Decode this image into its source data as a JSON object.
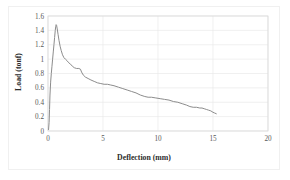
{
  "figure": {
    "background_color": "#ffffff",
    "frame_color": "#f0f0f0",
    "plot_border_color": "#d9d9d9",
    "grid_color": "#eaeaea",
    "line_color": "#8c8c8c",
    "tick_label_color": "#595959",
    "axis_title_color": "#2b2b2b"
  },
  "chart_data": {
    "type": "line",
    "title": "",
    "subtitle": "",
    "xlabel": "Deflection (mm)",
    "ylabel": "Load (tonf)",
    "xlim": [
      0,
      20
    ],
    "ylim": [
      0,
      1.6
    ],
    "xticks": [
      0,
      5,
      10,
      15,
      20
    ],
    "xtick_labels": [
      "0",
      "5",
      "10",
      "15",
      "20"
    ],
    "yticks": [
      0,
      0.2,
      0.4,
      0.6,
      0.8,
      1,
      1.2,
      1.4,
      1.6
    ],
    "ytick_labels": [
      "0",
      "0.2",
      "0.4",
      "0.6",
      "0.8",
      "1",
      "1.2",
      "1.4",
      "1.6"
    ],
    "grid": true,
    "grid_axis": "both",
    "legend": false,
    "legend_position": "none",
    "series": [
      {
        "name": "Load-deflection curve",
        "color": "#8c8c8c",
        "line_width": 1,
        "marker": "none",
        "points": [
          [
            0.05,
            0.02
          ],
          [
            0.1,
            0.12
          ],
          [
            0.14,
            0.3
          ],
          [
            0.18,
            0.5
          ],
          [
            0.24,
            0.68
          ],
          [
            0.3,
            0.8
          ],
          [
            0.36,
            0.9
          ],
          [
            0.42,
            1.0
          ],
          [
            0.48,
            1.1
          ],
          [
            0.54,
            1.2
          ],
          [
            0.6,
            1.3
          ],
          [
            0.66,
            1.4
          ],
          [
            0.7,
            1.45
          ],
          [
            0.74,
            1.48
          ],
          [
            0.78,
            1.47
          ],
          [
            0.84,
            1.42
          ],
          [
            0.92,
            1.34
          ],
          [
            1.0,
            1.26
          ],
          [
            1.1,
            1.18
          ],
          [
            1.2,
            1.12
          ],
          [
            1.32,
            1.06
          ],
          [
            1.45,
            1.02
          ],
          [
            1.58,
            1.0
          ],
          [
            1.72,
            0.98
          ],
          [
            1.88,
            0.95
          ],
          [
            2.05,
            0.93
          ],
          [
            2.22,
            0.9
          ],
          [
            2.4,
            0.88
          ],
          [
            2.6,
            0.87
          ],
          [
            2.8,
            0.87
          ],
          [
            2.95,
            0.86
          ],
          [
            3.05,
            0.82
          ],
          [
            3.2,
            0.78
          ],
          [
            3.4,
            0.75
          ],
          [
            3.65,
            0.73
          ],
          [
            3.9,
            0.71
          ],
          [
            4.2,
            0.69
          ],
          [
            4.5,
            0.67
          ],
          [
            4.8,
            0.66
          ],
          [
            5.1,
            0.65
          ],
          [
            5.4,
            0.65
          ],
          [
            5.7,
            0.64
          ],
          [
            6.0,
            0.63
          ],
          [
            6.4,
            0.61
          ],
          [
            6.8,
            0.59
          ],
          [
            7.2,
            0.57
          ],
          [
            7.6,
            0.55
          ],
          [
            8.0,
            0.53
          ],
          [
            8.4,
            0.5
          ],
          [
            8.8,
            0.48
          ],
          [
            9.1,
            0.47
          ],
          [
            9.4,
            0.47
          ],
          [
            9.8,
            0.46
          ],
          [
            10.2,
            0.45
          ],
          [
            10.6,
            0.44
          ],
          [
            11.0,
            0.43
          ],
          [
            11.4,
            0.41
          ],
          [
            11.8,
            0.4
          ],
          [
            12.2,
            0.38
          ],
          [
            12.6,
            0.36
          ],
          [
            12.9,
            0.34
          ],
          [
            13.2,
            0.33
          ],
          [
            13.5,
            0.33
          ],
          [
            13.8,
            0.32
          ],
          [
            14.0,
            0.32
          ],
          [
            14.2,
            0.31
          ],
          [
            14.4,
            0.3
          ],
          [
            14.6,
            0.29
          ],
          [
            14.8,
            0.28
          ],
          [
            15.0,
            0.26
          ],
          [
            15.15,
            0.25
          ],
          [
            15.3,
            0.24
          ]
        ]
      }
    ],
    "annotations": []
  }
}
